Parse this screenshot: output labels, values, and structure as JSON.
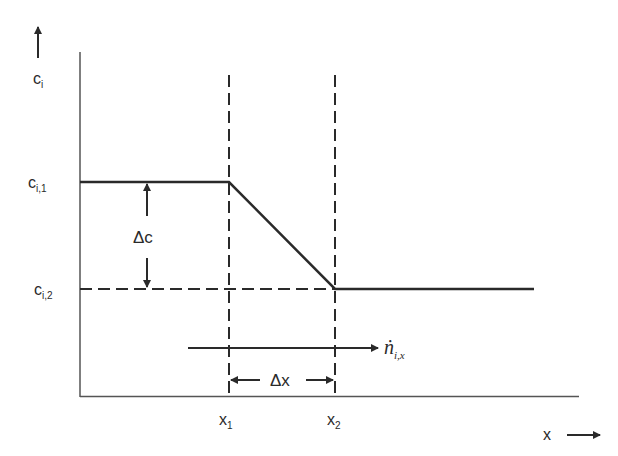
{
  "diagram": {
    "type": "concentration-profile",
    "y_axis_label": {
      "main": "c",
      "sub": "i"
    },
    "x_axis_label": "x",
    "levels": [
      {
        "main": "c",
        "sub": "i,1"
      },
      {
        "main": "c",
        "sub": "i,2"
      }
    ],
    "positions": [
      {
        "main": "x",
        "sub": "1"
      },
      {
        "main": "x",
        "sub": "2"
      }
    ],
    "delta_c_label": "Δc",
    "delta_x_label": "Δx",
    "flux_label": {
      "main": "ṅ",
      "sub": "i,x"
    },
    "colors": {
      "line": "#2a2a2a",
      "background": "#ffffff"
    }
  }
}
